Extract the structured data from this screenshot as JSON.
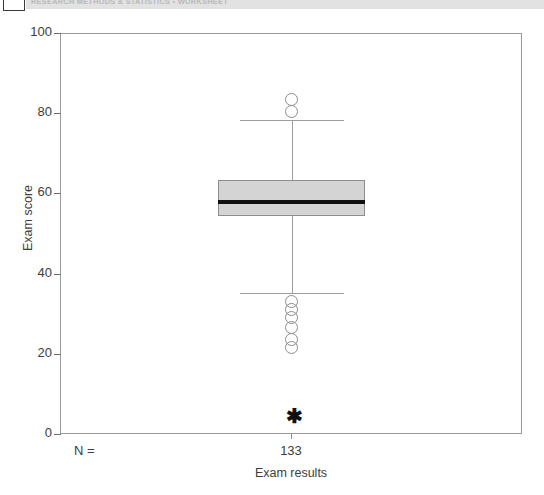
{
  "header": {
    "text": "RESEARCH METHODS & STATISTICS • WORKSHEET",
    "band_color": "#e2e2e2",
    "text_color": "#b9b9b9"
  },
  "figure": {
    "frame_color": "#9a9a9a",
    "background": "#ffffff"
  },
  "chart_data": {
    "type": "box",
    "title": "",
    "xlabel": "Exam results",
    "ylabel": "Exam score",
    "ylim": [
      0,
      100
    ],
    "yticks": [
      0,
      20,
      40,
      60,
      80,
      100
    ],
    "ytick_labels": [
      "0",
      "20",
      "40",
      "60",
      "80",
      "100"
    ],
    "grid": false,
    "legend": false,
    "n_label": "N =",
    "categories": [
      "Exam results"
    ],
    "counts": [
      "133"
    ],
    "boxes": [
      {
        "category": "Exam results",
        "n": 133,
        "q1": 54.4,
        "median": 57.8,
        "q3": 63.3,
        "whisker_low": 35.2,
        "whisker_high": 78.3,
        "mild_outliers": [
          83.5,
          80.5,
          33.0,
          31.0,
          29.0,
          26.5,
          23.5,
          21.5
        ],
        "extreme_outliers": [
          5.0
        ],
        "box_fill": "#d4d4d4",
        "box_edge": "#8d8d8d",
        "median_color": "#101010",
        "whisker_color": "#9d9d9d",
        "outlier_marker": "circle",
        "extreme_marker": "asterisk"
      }
    ]
  }
}
